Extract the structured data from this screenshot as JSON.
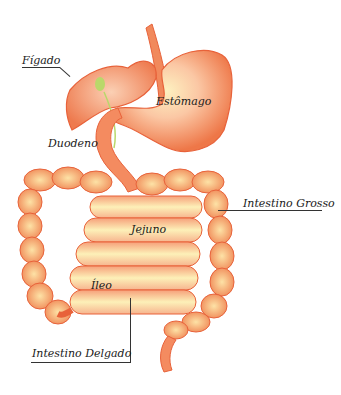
{
  "diagram": {
    "labels": {
      "liver": "Fígado",
      "stomach": "Estômago",
      "duodenum": "Duodeno",
      "large_intestine": "Intestino Grosso",
      "jejunum": "Jejuno",
      "ileum": "Íleo",
      "small_intestine": "Intestino Delgado"
    },
    "colors": {
      "organ_outline": "#e8623a",
      "organ_fill": "#f6a47e",
      "highlight": "#fbe58c",
      "gallbladder": "#b9d86a",
      "leader_line": "#333333"
    }
  }
}
